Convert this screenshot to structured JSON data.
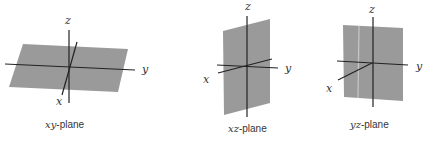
{
  "figure": {
    "panels": [
      {
        "id": "xy",
        "caption_vars": "xy",
        "caption_suffix": "-plane",
        "axis_labels": {
          "x": "x",
          "y": "y",
          "z": "z"
        },
        "plane_color": "#9a9a9a"
      },
      {
        "id": "xz",
        "caption_vars": "xz",
        "caption_suffix": "-plane",
        "axis_labels": {
          "x": "x",
          "y": "y",
          "z": "z"
        },
        "plane_color": "#9a9a9a"
      },
      {
        "id": "yz",
        "caption_vars": "yz",
        "caption_suffix": "-plane",
        "axis_labels": {
          "x": "x",
          "y": "y",
          "z": "z"
        },
        "plane_color": "#9a9a9a"
      }
    ]
  }
}
